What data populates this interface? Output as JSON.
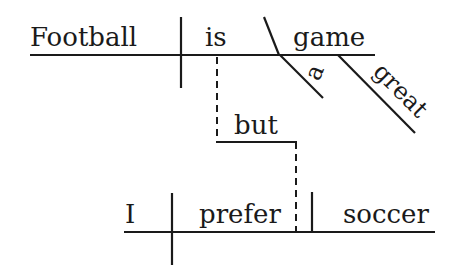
{
  "diagram": {
    "type": "sentence-diagram",
    "sentence": "Football is a great game, but I prefer soccer.",
    "clause1": {
      "subject": "Football",
      "verb": "is",
      "complement": "game",
      "modifiers": [
        "a",
        "great"
      ]
    },
    "conjunction": "but",
    "clause2": {
      "subject": "I",
      "verb": "prefer",
      "object": "soccer"
    },
    "colors": {
      "ink": "#1a1a1a",
      "background": "#ffffff"
    }
  }
}
